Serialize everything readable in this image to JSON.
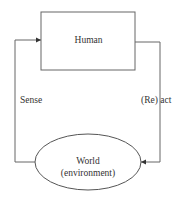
{
  "diagram": {
    "type": "feedback-loop",
    "nodes": [
      {
        "id": "human",
        "shape": "rectangle",
        "label": "Human"
      },
      {
        "id": "world",
        "shape": "ellipse",
        "label_line1": "World",
        "label_line2": "(environment)"
      }
    ],
    "edges": [
      {
        "from": "human",
        "to": "world",
        "label": "(Re) act",
        "side": "right"
      },
      {
        "from": "world",
        "to": "human",
        "label": "Sense",
        "side": "left"
      }
    ],
    "colors": {
      "stroke": "#555555",
      "text": "#333333",
      "background": "#ffffff"
    }
  }
}
